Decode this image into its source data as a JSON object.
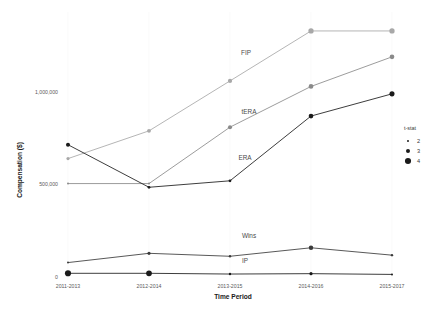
{
  "chart_data": {
    "type": "line",
    "title": "",
    "xlabel": "Time Period",
    "ylabel": "Compensation ($)",
    "categories": [
      "2011-2013",
      "2012-2014",
      "2013-2015",
      "2014-2016",
      "2015-2017"
    ],
    "ylim": [
      0,
      1400000
    ],
    "yticks": [
      0,
      500000,
      1000000
    ],
    "ytick_labels": [
      "0",
      "500,000",
      "1,000,000"
    ],
    "grid": false,
    "legend": {
      "title": "t-stat",
      "position": "right",
      "entries": [
        {
          "label": "2",
          "size": 2
        },
        {
          "label": "3",
          "size": 3
        },
        {
          "label": "4",
          "size": 4
        }
      ]
    },
    "series": [
      {
        "name": "FIP",
        "color": "#a8a8a8",
        "values": [
          640000,
          790000,
          1060000,
          1330000,
          1330000
        ],
        "tstats": [
          2.6,
          2.9,
          3.1,
          3.6,
          3.6
        ]
      },
      {
        "name": "tERA",
        "color": "#8a8a8a",
        "values": [
          505000,
          505000,
          810000,
          1030000,
          1190000
        ],
        "tstats": [
          2.0,
          2.0,
          3.0,
          3.3,
          3.3
        ]
      },
      {
        "name": "ERA",
        "color": "#1a1a1a",
        "values": [
          715000,
          485000,
          520000,
          870000,
          990000
        ],
        "tstats": [
          3.0,
          2.4,
          2.4,
          3.3,
          3.5
        ]
      },
      {
        "name": "Wins",
        "color": "#3a3a3a",
        "values": [
          78000,
          128000,
          112000,
          158000,
          118000
        ],
        "tstats": [
          2.0,
          2.6,
          2.2,
          3.2,
          2.2
        ]
      },
      {
        "name": "IP",
        "color": "#1a1a1a",
        "values": [
          20000,
          20000,
          16000,
          18000,
          14000
        ],
        "tstats": [
          4.0,
          3.8,
          2.2,
          2.6,
          2.0
        ]
      }
    ]
  }
}
